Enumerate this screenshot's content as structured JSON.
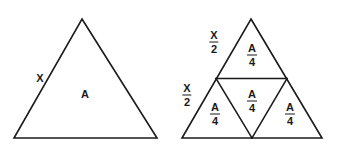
{
  "figure": {
    "background_color": "#ffffff",
    "stroke_color": "#1a1a1a",
    "text_color": "#1a1a1a"
  },
  "left_figure": {
    "name": "whole-triangle",
    "side_label": "X",
    "area_label": "A",
    "vertices": {
      "apex": [
        82,
        19
      ],
      "base_left": [
        14,
        138
      ],
      "base_right": [
        157,
        138
      ]
    }
  },
  "right_figure": {
    "name": "subdivided-triangle",
    "vertices": {
      "apex": [
        251,
        19
      ],
      "base_left": [
        182,
        138
      ],
      "base_right": [
        322,
        138
      ]
    },
    "midpoints": {
      "left_side": [
        216,
        78
      ],
      "right_side": [
        287,
        78
      ],
      "base": [
        252,
        138
      ]
    },
    "side_labels": [
      {
        "id": "upper-left-side",
        "numerator": "X",
        "denominator": "2",
        "x": 214,
        "y": 40
      },
      {
        "id": "lower-left-side",
        "numerator": "X",
        "denominator": "2",
        "x": 187,
        "y": 93
      }
    ],
    "area_labels": [
      {
        "id": "top-sub-triangle",
        "numerator": "A",
        "denominator": "4",
        "x": 252,
        "y": 53
      },
      {
        "id": "center-sub-triangle",
        "numerator": "A",
        "denominator": "4",
        "x": 252,
        "y": 99
      },
      {
        "id": "bottom-left-sub-triangle",
        "numerator": "A",
        "denominator": "4",
        "x": 215,
        "y": 112
      },
      {
        "id": "bottom-right-sub-triangle",
        "numerator": "A",
        "denominator": "4",
        "x": 290,
        "y": 112
      }
    ]
  }
}
